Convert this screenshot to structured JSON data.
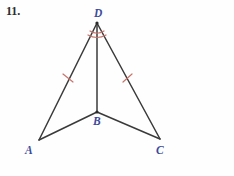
{
  "page": {
    "problem_number": "11.",
    "background_color": "#fefefe"
  },
  "figure": {
    "name": "two-triangles-sharing-segment-DB",
    "stroke_color": "#3a3a3a",
    "mark_color": "#c9736b",
    "label_color": "#3c4a9c",
    "vertices": [
      {
        "id": "D",
        "label": "D",
        "x": 97,
        "y": 23
      },
      {
        "id": "B",
        "label": "B",
        "x": 97,
        "y": 112
      },
      {
        "id": "A",
        "label": "A",
        "x": 39,
        "y": 140
      },
      {
        "id": "C",
        "label": "C",
        "x": 160,
        "y": 139
      }
    ],
    "segments": [
      {
        "id": "DA",
        "from": "D",
        "to": "A",
        "path": "M 97 23 L 39 140"
      },
      {
        "id": "DC",
        "from": "D",
        "to": "C",
        "path": "M 97 23 L 160 139"
      },
      {
        "id": "DB",
        "from": "D",
        "to": "B",
        "path": "M 97 23 L 97 112"
      },
      {
        "id": "BA",
        "from": "B",
        "to": "A",
        "path": "M 97 112 L 39 140"
      },
      {
        "id": "BC",
        "from": "B",
        "to": "C",
        "path": "M 97 112 L 160 139"
      }
    ],
    "congruence_ticks": [
      {
        "id": "tick-DA",
        "on_segment": "DA",
        "count": 1,
        "path": "M 63 74 L 73 82"
      },
      {
        "id": "tick-DC",
        "on_segment": "DC",
        "count": 1,
        "path": "M 123 82 L 132 74"
      }
    ],
    "angle_arcs": [
      {
        "id": "arc-D-outer",
        "at_vertex": "D",
        "path": "M 88 35 Q 97 40 106 35"
      },
      {
        "id": "arc-D-inner",
        "at_vertex": "D",
        "path": "M 90 31 Q 97 35.5 104 31"
      }
    ]
  }
}
